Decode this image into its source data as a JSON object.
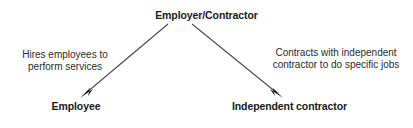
{
  "diagram": {
    "title_node": {
      "id": "employer-contractor",
      "label": "Employer/Contractor"
    },
    "child_nodes": [
      {
        "id": "employee",
        "label": "Employee"
      },
      {
        "id": "independent-contractor",
        "label": "Independent contractor"
      }
    ],
    "edges": [
      {
        "id": "employer-to-employee",
        "from": "employer-contractor",
        "to": "employee",
        "arrowhead": "filled-triangle",
        "caption_lines": [
          "Hires employees to",
          "perform services"
        ]
      },
      {
        "id": "employer-to-independent-contractor",
        "from": "employer-contractor",
        "to": "independent-contractor",
        "arrowhead": "filled-triangle",
        "caption_lines": [
          "Contracts with independent",
          "contractor to do specific jobs"
        ]
      }
    ],
    "colors": {
      "background": "#ffffff",
      "node_text": "#1a1a1a",
      "caption_text": "#2b2b2b",
      "arrow_line": "#4a4a4a",
      "arrow_head": "#111111"
    }
  }
}
